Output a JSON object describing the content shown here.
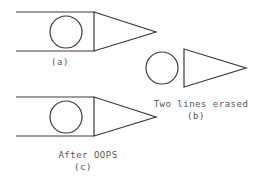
{
  "figure": {
    "panels": [
      {
        "id": "a",
        "label": "(a)",
        "caption": ""
      },
      {
        "id": "b",
        "label": "(b)",
        "caption": "Two lines erased"
      },
      {
        "id": "c",
        "label": "(c)",
        "caption": "After OOPS"
      }
    ],
    "colors": {
      "stroke": "#3a3a3a",
      "text": "#555555",
      "background": "#ffffff"
    }
  }
}
